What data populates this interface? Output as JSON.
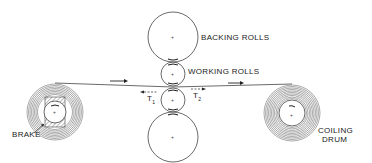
{
  "diagram": {
    "labels": {
      "backing_rolls": "BACKING ROLLS",
      "working_rolls": "WORKING ROLLS",
      "brake": "BRAKE",
      "coiling_drum_line1": "COILING",
      "coiling_drum_line2": "DRUM",
      "tension_1": "T",
      "tension_1_sub": "1",
      "tension_2": "T",
      "tension_2_sub": "2"
    },
    "components": [
      {
        "name": "top-backing-roll",
        "cx": 173,
        "cy": 37,
        "r": 25
      },
      {
        "name": "upper-working-roll",
        "cx": 173,
        "cy": 74,
        "r": 12
      },
      {
        "name": "lower-working-roll",
        "cx": 173,
        "cy": 100,
        "r": 12
      },
      {
        "name": "bottom-backing-roll",
        "cx": 173,
        "cy": 137,
        "r": 25
      },
      {
        "name": "brake-coil",
        "cx": 55,
        "cy": 112,
        "r_outer": 29,
        "r_inner": 12
      },
      {
        "name": "coiling-drum",
        "cx": 292,
        "cy": 113,
        "r_outer": 29,
        "r_inner": 13
      }
    ],
    "strip_direction": "left-to-right",
    "colors": {
      "line": "#333333",
      "background": "#ffffff"
    }
  }
}
